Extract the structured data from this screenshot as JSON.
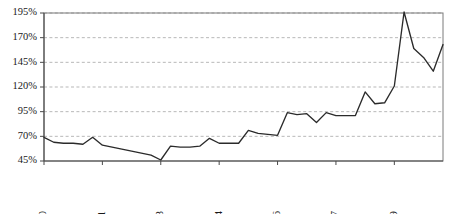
{
  "chart_data": {
    "type": "line",
    "title": "",
    "subtitle": "",
    "xlabel": "",
    "ylabel": "",
    "grid": "horizontal-dashed",
    "legend": "none",
    "line_color": "#2b2b2b",
    "gridline_color": "#9a9a9a",
    "axis_color": "#4a4a4a",
    "frame_color": "#7a7a7a",
    "background_color": "#ffffff",
    "ylim": [
      45,
      195
    ],
    "ytick_values": [
      195,
      170,
      145,
      120,
      95,
      70,
      45
    ],
    "ytick_labels": [
      "195%",
      "170%",
      "145%",
      "120%",
      "95%",
      "70%",
      "45%"
    ],
    "xtick_labels": [
      "Mar-00",
      "Sep-01",
      "Mar-03",
      "Sep-04",
      "Mar-06",
      "Sep-07",
      "Mar-09"
    ],
    "xtick_indices": [
      0,
      6,
      12,
      18,
      24,
      30,
      36
    ],
    "xtick_rotation": -90,
    "x": [
      "Mar-00",
      "Jun-00",
      "Sep-00",
      "Dec-00",
      "Mar-01",
      "Jun-01",
      "Sep-01",
      "Dec-01",
      "Mar-02",
      "Jun-02",
      "Sep-02",
      "Dec-02",
      "Mar-03",
      "Jun-03",
      "Sep-03",
      "Dec-03",
      "Mar-04",
      "Jun-04",
      "Sep-04",
      "Dec-04",
      "Mar-05",
      "Jun-05",
      "Sep-05",
      "Dec-05",
      "Mar-06",
      "Jun-06",
      "Sep-06",
      "Dec-06",
      "Mar-07",
      "Jun-07",
      "Sep-07",
      "Dec-07",
      "Mar-08",
      "Jun-08",
      "Sep-08",
      "Dec-08",
      "Mar-09",
      "Jun-09",
      "Sep-09",
      "Dec-09",
      "Mar-10",
      "Jun-10"
    ],
    "series": [
      {
        "name": "Index",
        "values": [
          69,
          64,
          63,
          63,
          62,
          69,
          61,
          59,
          57,
          55,
          53,
          51,
          46,
          60,
          59,
          59,
          60,
          68,
          63,
          63,
          63,
          76,
          73,
          72,
          71,
          94,
          92,
          93,
          84,
          94,
          91,
          91,
          91,
          115,
          103,
          104,
          121,
          196,
          159,
          150,
          136,
          163
        ]
      }
    ]
  }
}
